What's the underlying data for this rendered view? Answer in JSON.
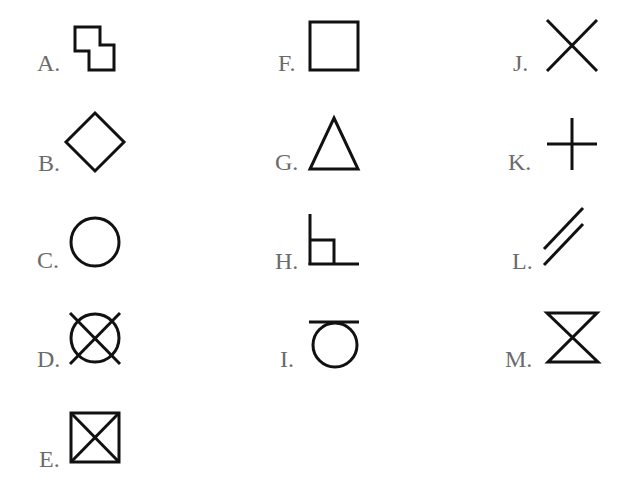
{
  "figure": {
    "items": [
      {
        "letter": "A.",
        "shape": "two-offset-squares-icon",
        "description": "two overlapping squares offset diagonally"
      },
      {
        "letter": "B.",
        "shape": "diamond-icon",
        "description": "square rotated 45 degrees"
      },
      {
        "letter": "C.",
        "shape": "circle-icon",
        "description": "circle"
      },
      {
        "letter": "D.",
        "shape": "crossed-circle-icon",
        "description": "circle with X through it"
      },
      {
        "letter": "E.",
        "shape": "crossed-square-icon",
        "description": "square with both diagonals"
      },
      {
        "letter": "F.",
        "shape": "square-icon",
        "description": "square"
      },
      {
        "letter": "G.",
        "shape": "triangle-icon",
        "description": "triangle"
      },
      {
        "letter": "H.",
        "shape": "right-angle-with-square-icon",
        "description": "right angle with small square marker"
      },
      {
        "letter": "I.",
        "shape": "circle-under-line-icon",
        "description": "circle beneath horizontal line"
      },
      {
        "letter": "J.",
        "shape": "x-cross-icon",
        "description": "diagonal cross (X)"
      },
      {
        "letter": "K.",
        "shape": "plus-cross-icon",
        "description": "plus sign"
      },
      {
        "letter": "L.",
        "shape": "parallel-lines-icon",
        "description": "two parallel diagonal lines"
      },
      {
        "letter": "M.",
        "shape": "hourglass-icon",
        "description": "hourglass shape"
      }
    ],
    "colors": {
      "stroke": "#111111",
      "label": "#6b6b6b",
      "background": "#ffffff"
    }
  }
}
